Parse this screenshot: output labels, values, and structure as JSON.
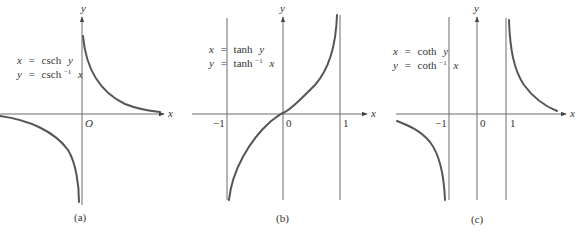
{
  "figure": {
    "panels": [
      {
        "id": "a",
        "caption": "(a)",
        "equation_1": {
          "lhs": "x",
          "eq": "=",
          "fn": "csch",
          "arg": "y"
        },
        "equation_2": {
          "lhs": "y",
          "eq": "=",
          "fn": "csch",
          "sup": "−1",
          "arg": "x"
        },
        "axis_x_label": "x",
        "axis_y_label": "y",
        "origin_label": "O",
        "tick_labels": []
      },
      {
        "id": "b",
        "caption": "(b)",
        "equation_1": {
          "lhs": "x",
          "eq": "=",
          "fn": "tanh",
          "arg": "y"
        },
        "equation_2": {
          "lhs": "y",
          "eq": "=",
          "fn": "tanh",
          "sup": "−1",
          "arg": "x"
        },
        "axis_x_label": "x",
        "axis_y_label": "y",
        "tick_labels": [
          "−1",
          "0",
          "1"
        ]
      },
      {
        "id": "c",
        "caption": "(c)",
        "equation_1": {
          "lhs": "x",
          "eq": "=",
          "fn": "coth",
          "arg": "y"
        },
        "equation_2": {
          "lhs": "y",
          "eq": "=",
          "fn": "coth",
          "sup": "−1",
          "arg": "x"
        },
        "axis_x_label": "x",
        "axis_y_label": "y",
        "tick_labels": [
          "−1",
          "0",
          "1"
        ]
      }
    ],
    "colors": {
      "axis": "#6b6b6b",
      "curve": "#555555",
      "text": "#333333"
    }
  }
}
